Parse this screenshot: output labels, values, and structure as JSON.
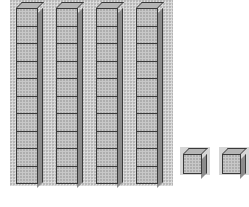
{
  "figure": {
    "rods": {
      "count": 4,
      "cubes_per_rod": 10,
      "x_positions": [
        16,
        56,
        96,
        136
      ]
    },
    "units": {
      "count": 2,
      "x_positions": [
        183,
        222
      ]
    },
    "represented_value": 42,
    "colors": {
      "fill": "#c8c8c8",
      "edge": "#3a3a3a",
      "side": "#8c8c8c",
      "background": "#cfcfcf"
    }
  }
}
